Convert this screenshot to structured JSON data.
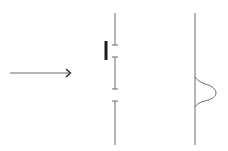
{
  "diagram": {
    "type": "double-slit-like schematic",
    "colors": {
      "line": "#6b6b6b",
      "detector_bar": "#1e1e1e",
      "background": "#ffffff"
    },
    "incoming_arrow": {
      "x1": 10,
      "x2": 70,
      "y": 73
    },
    "barrier": {
      "x": 115,
      "segments": [
        {
          "y1": 13,
          "y2": 45
        },
        {
          "y1": 57,
          "y2": 89
        },
        {
          "y1": 101,
          "y2": 145
        }
      ],
      "slits": [
        {
          "y_top": 45,
          "y_bottom": 57,
          "label": "slit-1"
        },
        {
          "y_top": 89,
          "y_bottom": 101,
          "label": "slit-2"
        }
      ]
    },
    "which_path_detector": {
      "x": 106,
      "y1": 41,
      "y2": 60,
      "position": "slit-1"
    },
    "screen": {
      "x": 195,
      "y1": 13,
      "y2": 145,
      "pattern": {
        "shape": "single-peak",
        "peak_y": 93,
        "peak_x": 216,
        "span_y": [
          77,
          107
        ]
      }
    }
  }
}
